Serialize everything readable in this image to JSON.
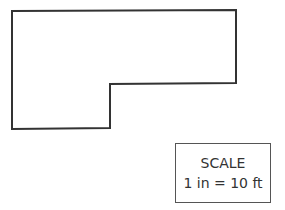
{
  "diagram": {
    "type": "floor-plan-outline",
    "shape": "L-shaped polygon",
    "stroke_color": "#333333",
    "vertices": [
      [
        12,
        11
      ],
      [
        236,
        10
      ],
      [
        236,
        83
      ],
      [
        110,
        84
      ],
      [
        110,
        128
      ],
      [
        12,
        129
      ]
    ]
  },
  "scale": {
    "title": "SCALE",
    "ratio": "1 in = 10 ft"
  }
}
